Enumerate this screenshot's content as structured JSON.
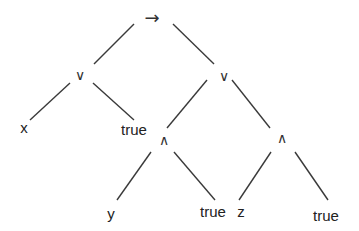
{
  "diagram": {
    "type": "expression-tree",
    "nodes": {
      "root": {
        "label": "→",
        "x": 152,
        "y": 18
      },
      "or_left": {
        "label": "∨",
        "x": 80,
        "y": 75
      },
      "or_right": {
        "label": "∨",
        "x": 224,
        "y": 76
      },
      "x": {
        "label": "x",
        "x": 24,
        "y": 127
      },
      "true1": {
        "label": "true",
        "x": 134,
        "y": 129
      },
      "and_left": {
        "label": "∧",
        "x": 164,
        "y": 140
      },
      "and_right": {
        "label": "∧",
        "x": 282,
        "y": 138
      },
      "y": {
        "label": "y",
        "x": 111,
        "y": 213
      },
      "true2": {
        "label": "true",
        "x": 213,
        "y": 211
      },
      "z": {
        "label": "z",
        "x": 241,
        "y": 211
      },
      "true3": {
        "label": "true",
        "x": 326,
        "y": 215
      }
    },
    "edges": [
      {
        "from": "root",
        "to": "or_left",
        "x1": 134,
        "y1": 24,
        "x2": 94,
        "y2": 64
      },
      {
        "from": "root",
        "to": "or_right",
        "x1": 173,
        "y1": 24,
        "x2": 214,
        "y2": 64
      },
      {
        "from": "or_left",
        "to": "x",
        "x1": 70,
        "y1": 83,
        "x2": 30,
        "y2": 120
      },
      {
        "from": "or_left",
        "to": "true1",
        "x1": 93,
        "y1": 83,
        "x2": 134,
        "y2": 120
      },
      {
        "from": "or_right",
        "to": "and_left",
        "x1": 207,
        "y1": 80,
        "x2": 167,
        "y2": 128
      },
      {
        "from": "or_right",
        "to": "and_right",
        "x1": 232,
        "y1": 80,
        "x2": 270,
        "y2": 128
      },
      {
        "from": "and_left",
        "to": "y",
        "x1": 151,
        "y1": 152,
        "x2": 117,
        "y2": 200
      },
      {
        "from": "and_left",
        "to": "true2",
        "x1": 174,
        "y1": 152,
        "x2": 215,
        "y2": 200
      },
      {
        "from": "and_right",
        "to": "z",
        "x1": 271,
        "y1": 152,
        "x2": 239,
        "y2": 200
      },
      {
        "from": "and_right",
        "to": "true3",
        "x1": 295,
        "y1": 152,
        "x2": 328,
        "y2": 200
      }
    ]
  }
}
